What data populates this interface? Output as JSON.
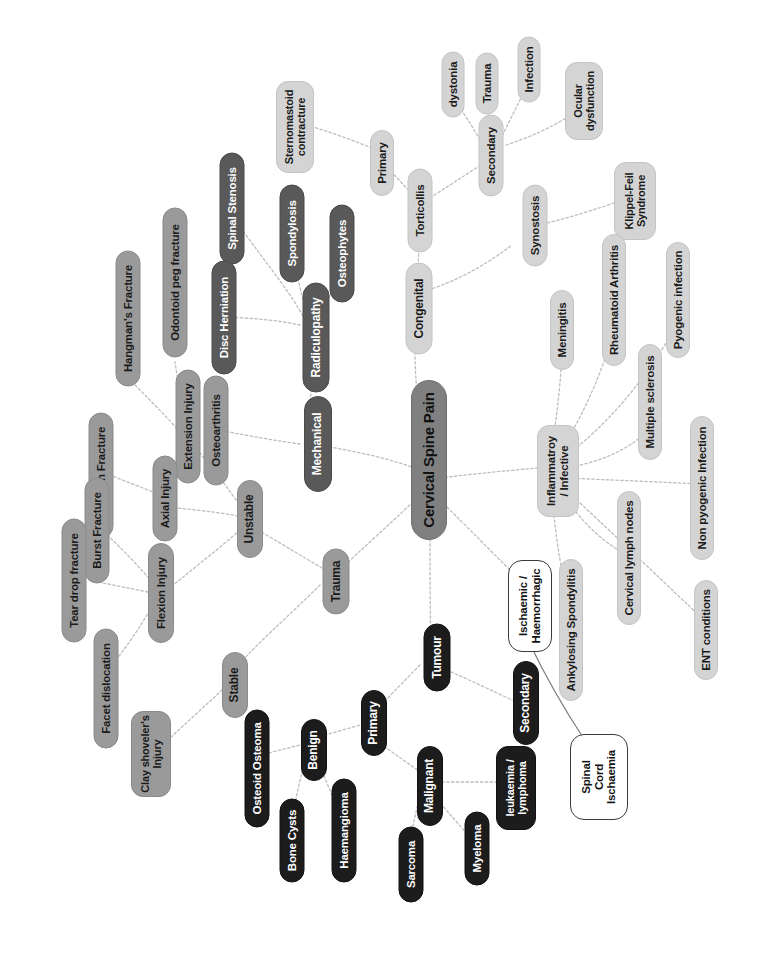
{
  "diagram": {
    "title": "Cervical Spine Pain",
    "type": "mind-map",
    "orientation": "rotated-90-ccw",
    "canvas": {
      "width": 765,
      "height": 967
    },
    "palette": {
      "root": "#808080",
      "dark": "#595959",
      "mid": "#9a9a9a",
      "light": "#d4d4d4",
      "black": "#1c1c1c",
      "outline_fill": "#ffffff",
      "outline_stroke": "#3c3c3c",
      "edge": "#b6b6b6",
      "background": "#ffffff"
    }
  },
  "nodes": {
    "root": "Cervical Spine Pain",
    "mechanical": "Mechanical",
    "radiculopathy": "Radiculopathy",
    "spinal_stenosis": "Spinal Stenosis",
    "spondylosis": "Spondylosis",
    "osteophytes": "Osteophytes",
    "disc_herniation": "Disc Herniation",
    "osteoarthritis": "Osteoarthritis",
    "congenital": "Congenital",
    "torticollis": "Torticollis",
    "primary_tort": "Primary",
    "sternomastoid": "Sternomastoid\ncontracture",
    "secondary_tort": "Secondary",
    "dystonia": "dystonia",
    "trauma_tort": "Trauma",
    "infection_tort": "Infection",
    "ocular_dysfunction": "Ocular\ndysfunction",
    "synostosis": "Synostosis",
    "klippel_feil": "Klippel-Feil\nSyndrome",
    "trauma": "Trauma",
    "unstable": "Unstable",
    "stable": "Stable",
    "extension_injury": "Extension Injury",
    "hangmans_fracture": "Hangman's Fracture",
    "odontoid_peg": "Odontoid peg fracture",
    "axial_injury": "Axial Injury",
    "jefferson_fracture": "Jefferson Fracture",
    "flexion_injury": "Flexion Injury",
    "burst_fracture": "Burst Fracture",
    "tear_drop": "Tear drop fracture",
    "facet_dislocation": "Facet dislocation",
    "clay_shovelers": "Clay shoveler's\nInjury",
    "tumour": "Tumour",
    "primary_tumour": "Primary",
    "secondary_tumour": "Secondary",
    "benign": "Benign",
    "osteoid_osteoma": "Osteoid Osteoma",
    "bone_cysts": "Bone Cysts",
    "haemangioma": "Haemangioma",
    "malignant": "Malignant",
    "sarcoma": "Sarcoma",
    "myeloma": "Myeloma",
    "leukaemia_lymphoma": "leukaemia /\nlymphoma",
    "inflammatory": "Inflammatroy\n/ Infective",
    "meningitis": "Meningitis",
    "rheumatoid_arthritis": "Rheumatoid Arthritis",
    "pyogenic_infection": "Pyogenic infection",
    "multiple_sclerosis": "Multiple sclerosis",
    "non_pyogenic": "Non pyogenic Infection",
    "cervical_lymph_nodes": "Cervical lymph nodes",
    "ankylosing_spondylitis": "Ankylosing Spondylitis",
    "ent_conditions": "ENT conditions",
    "ischaemic_haemorrhagic": "Ischaemic /\nHaemorrhagic",
    "spinal_cord_ischaemia": "Spinal\nCord\nIschaemia"
  },
  "edges": [
    [
      "root",
      "mechanical"
    ],
    [
      "root",
      "congenital"
    ],
    [
      "root",
      "trauma"
    ],
    [
      "root",
      "tumour"
    ],
    [
      "root",
      "inflammatory"
    ],
    [
      "root",
      "ischaemic_haemorrhagic"
    ],
    [
      "mechanical",
      "radiculopathy"
    ],
    [
      "mechanical",
      "osteoarthritis"
    ],
    [
      "radiculopathy",
      "spinal_stenosis"
    ],
    [
      "radiculopathy",
      "spondylosis"
    ],
    [
      "radiculopathy",
      "osteophytes"
    ],
    [
      "radiculopathy",
      "disc_herniation"
    ],
    [
      "congenital",
      "torticollis"
    ],
    [
      "congenital",
      "synostosis"
    ],
    [
      "synostosis",
      "klippel_feil"
    ],
    [
      "torticollis",
      "primary_tort"
    ],
    [
      "torticollis",
      "secondary_tort"
    ],
    [
      "primary_tort",
      "sternomastoid"
    ],
    [
      "secondary_tort",
      "dystonia"
    ],
    [
      "secondary_tort",
      "trauma_tort"
    ],
    [
      "secondary_tort",
      "infection_tort"
    ],
    [
      "secondary_tort",
      "ocular_dysfunction"
    ],
    [
      "trauma",
      "unstable"
    ],
    [
      "trauma",
      "stable"
    ],
    [
      "unstable",
      "extension_injury"
    ],
    [
      "unstable",
      "axial_injury"
    ],
    [
      "unstable",
      "flexion_injury"
    ],
    [
      "extension_injury",
      "hangmans_fracture"
    ],
    [
      "extension_injury",
      "odontoid_peg"
    ],
    [
      "axial_injury",
      "jefferson_fracture"
    ],
    [
      "flexion_injury",
      "burst_fracture"
    ],
    [
      "flexion_injury",
      "tear_drop"
    ],
    [
      "flexion_injury",
      "facet_dislocation"
    ],
    [
      "stable",
      "clay_shovelers"
    ],
    [
      "tumour",
      "primary_tumour"
    ],
    [
      "tumour",
      "secondary_tumour"
    ],
    [
      "primary_tumour",
      "benign"
    ],
    [
      "primary_tumour",
      "malignant"
    ],
    [
      "benign",
      "osteoid_osteoma"
    ],
    [
      "benign",
      "bone_cysts"
    ],
    [
      "benign",
      "haemangioma"
    ],
    [
      "malignant",
      "sarcoma"
    ],
    [
      "malignant",
      "myeloma"
    ],
    [
      "malignant",
      "leukaemia_lymphoma"
    ],
    [
      "inflammatory",
      "meningitis"
    ],
    [
      "inflammatory",
      "rheumatoid_arthritis"
    ],
    [
      "inflammatory",
      "pyogenic_infection"
    ],
    [
      "inflammatory",
      "multiple_sclerosis"
    ],
    [
      "inflammatory",
      "non_pyogenic"
    ],
    [
      "inflammatory",
      "cervical_lymph_nodes"
    ],
    [
      "inflammatory",
      "ankylosing_spondylitis"
    ],
    [
      "inflammatory",
      "ent_conditions"
    ],
    [
      "ischaemic_haemorrhagic",
      "spinal_cord_ischaemia"
    ]
  ]
}
